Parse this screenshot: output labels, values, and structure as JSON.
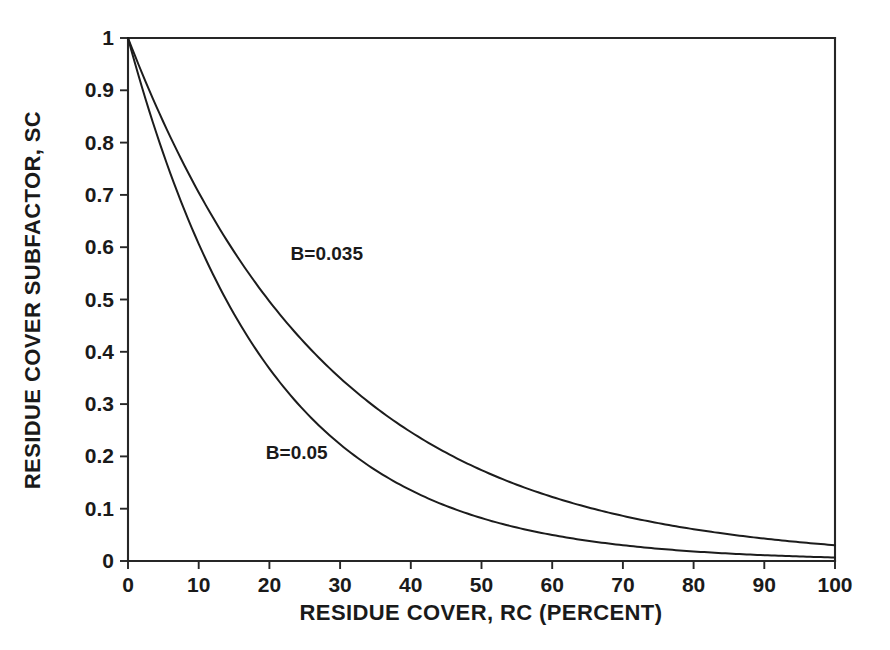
{
  "chart_data": {
    "type": "line",
    "title": "",
    "xlabel": "RESIDUE COVER, RC (PERCENT)",
    "ylabel": "RESIDUE COVER SUBFACTOR, SC",
    "xlim": [
      0,
      100
    ],
    "ylim": [
      0,
      1
    ],
    "grid": false,
    "legend_position": "inline-annotation",
    "xticks": [
      0,
      10,
      20,
      30,
      40,
      50,
      60,
      70,
      80,
      90,
      100
    ],
    "xticklabels": [
      "0",
      "10",
      "20",
      "30",
      "40",
      "50",
      "60",
      "70",
      "80",
      "90",
      "100"
    ],
    "yticks": [
      0,
      0.1,
      0.2,
      0.3,
      0.4,
      0.5,
      0.6,
      0.7,
      0.8,
      0.9,
      1
    ],
    "yticklabels": [
      "0",
      "0.1",
      "0.2",
      "0.3",
      "0.4",
      "0.5",
      "0.6",
      "0.7",
      "0.8",
      "0.9",
      "1"
    ],
    "x": [
      0,
      5,
      10,
      15,
      20,
      25,
      30,
      35,
      40,
      45,
      50,
      55,
      60,
      65,
      70,
      75,
      80,
      85,
      90,
      95,
      100
    ],
    "series": [
      {
        "name": "B=0.035",
        "b": 0.035,
        "label_x": 23,
        "label_y": 0.575,
        "values": [
          1.0,
          0.839,
          0.705,
          0.592,
          0.497,
          0.417,
          0.35,
          0.294,
          0.247,
          0.207,
          0.174,
          0.146,
          0.122,
          0.103,
          0.086,
          0.072,
          0.061,
          0.051,
          0.043,
          0.036,
          0.03
        ]
      },
      {
        "name": "B=0.05",
        "b": 0.05,
        "label_x": 19.5,
        "label_y": 0.195,
        "values": [
          1.0,
          0.779,
          0.607,
          0.472,
          0.368,
          0.287,
          0.223,
          0.174,
          0.135,
          0.105,
          0.082,
          0.064,
          0.05,
          0.039,
          0.03,
          0.024,
          0.018,
          0.014,
          0.011,
          0.009,
          0.007
        ]
      }
    ],
    "annotations": [
      {
        "text": "B=0.035",
        "x": 23,
        "y": 0.575
      },
      {
        "text": "B=0.05",
        "x": 19.5,
        "y": 0.195
      }
    ],
    "equation": "SC = exp(-B * RC)",
    "colors": {
      "axis": "#262626",
      "curve": "#1c1c1c",
      "background": "#ffffff",
      "text": "#1a1a1a"
    }
  },
  "axes": {
    "x_title": "RESIDUE COVER, RC (PERCENT)",
    "y_title": "RESIDUE COVER SUBFACTOR, SC"
  }
}
